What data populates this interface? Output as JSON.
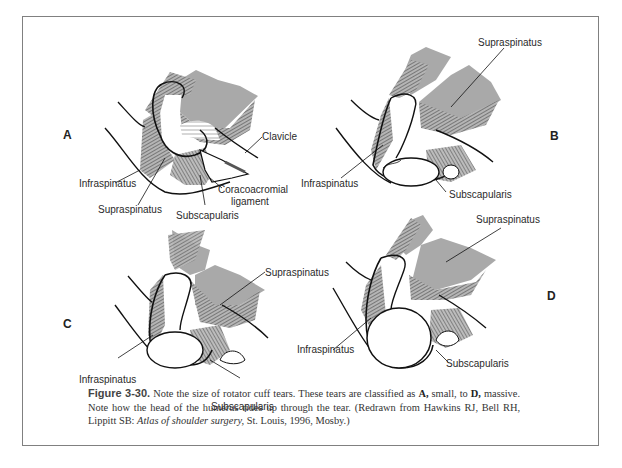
{
  "figure": {
    "number_label": "Figure 3-30.",
    "caption_part1": "Note the size of rotator cuff tears. These tears are classified as",
    "caption_bold_a": "A,",
    "caption_part2": "small, to",
    "caption_bold_d": "D,",
    "caption_part3": "massive. Note how the head of the humerus rides up through the tear. (Redrawn from Hawkins RJ, Bell RH, Lippitt SB:",
    "caption_italic_source": "Atlas of shoulder surgery,",
    "caption_part4": "St. Louis, 1996, Mosby.)"
  },
  "panels": [
    {
      "letter": "A",
      "tear_size": "small",
      "labels": {
        "clavicle": "Clavicle",
        "infraspinatus": "Infraspinatus",
        "coracoacromial_1": "Coracoacromial",
        "coracoacromial_2": "ligament",
        "supraspinatus": "Supraspinatus",
        "subscapularis": "Subscapularis"
      }
    },
    {
      "letter": "B",
      "labels": {
        "supraspinatus": "Supraspinatus",
        "infraspinatus": "Infraspinatus",
        "subscapularis": "Subscapularis"
      }
    },
    {
      "letter": "C",
      "labels": {
        "supraspinatus": "Supraspinatus",
        "infraspinatus": "Infraspinatus",
        "subscapularis": "Subscapularis"
      }
    },
    {
      "letter": "D",
      "tear_size": "massive",
      "labels": {
        "supraspinatus": "Supraspinatus",
        "infraspinatus": "Infraspinatus",
        "subscapularis": "Subscapularis"
      }
    }
  ],
  "colors": {
    "muscle_gray": "#a9a9a9",
    "hatch": "#444444",
    "outline": "#111111",
    "frame": "#808080"
  }
}
